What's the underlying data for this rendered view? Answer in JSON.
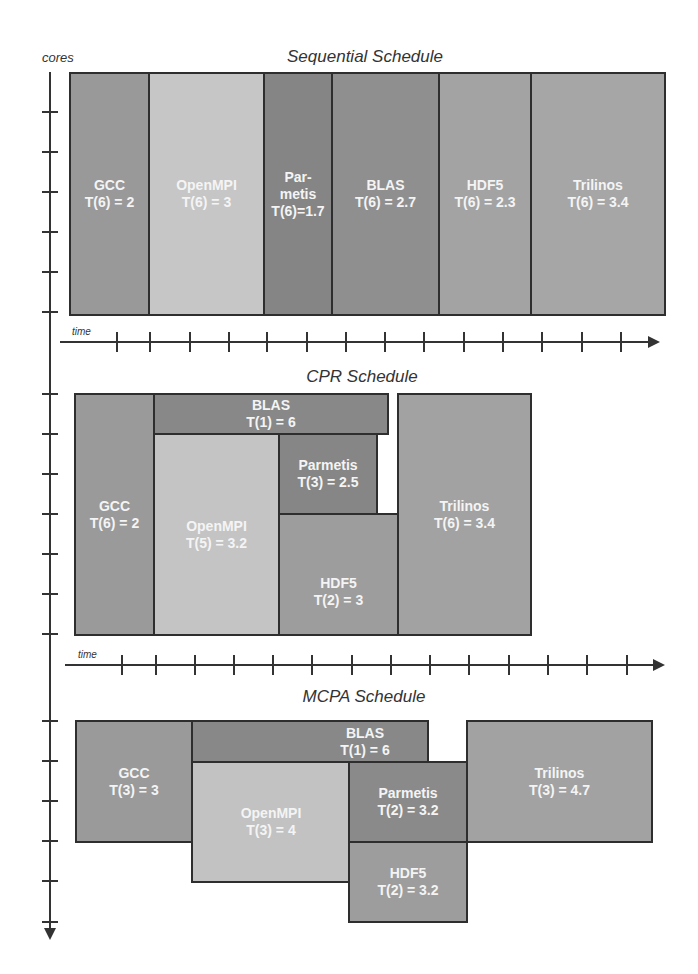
{
  "colors": {
    "dark": "#8a8a8a",
    "medium": "#a0a0a0",
    "light": "#c4c4c4",
    "border": "#2e2e2e",
    "text": "#f4f4f4"
  },
  "axes": {
    "y_label": "cores",
    "x_label": "time"
  },
  "schedules": {
    "sequential": {
      "title": "Sequential Schedule",
      "blocks": [
        {
          "name": "GCC",
          "time": "T(6) = 2"
        },
        {
          "name": "OpenMPI",
          "time": "T(6) = 3"
        },
        {
          "name": "Par-",
          "name2": "metis",
          "time": "T(6)=1.7"
        },
        {
          "name": "BLAS",
          "time": "T(6) = 2.7"
        },
        {
          "name": "HDF5",
          "time": "T(6) = 2.3"
        },
        {
          "name": "Trilinos",
          "time": "T(6) = 3.4"
        }
      ]
    },
    "cpr": {
      "title": "CPR Schedule",
      "blocks": [
        {
          "name": "GCC",
          "time": "T(6) = 2"
        },
        {
          "name": "BLAS",
          "time": "T(1) = 6"
        },
        {
          "name": "OpenMPI",
          "time": "T(5) = 3.2"
        },
        {
          "name": "Parmetis",
          "time": "T(3) = 2.5"
        },
        {
          "name": "HDF5",
          "time": "T(2) = 3"
        },
        {
          "name": "Trilinos",
          "time": "T(6) = 3.4"
        }
      ]
    },
    "mcpa": {
      "title": "MCPA Schedule",
      "blocks": [
        {
          "name": "GCC",
          "time": "T(3)  = 3"
        },
        {
          "name": "BLAS",
          "time": "T(1) = 6"
        },
        {
          "name": "OpenMPI",
          "time": "T(3) = 4"
        },
        {
          "name": "Parmetis",
          "time": "T(2)  = 3.2"
        },
        {
          "name": "HDF5",
          "time": "T(2) = 3.2"
        },
        {
          "name": "Trilinos",
          "time": "T(3) = 4.7"
        }
      ]
    }
  }
}
